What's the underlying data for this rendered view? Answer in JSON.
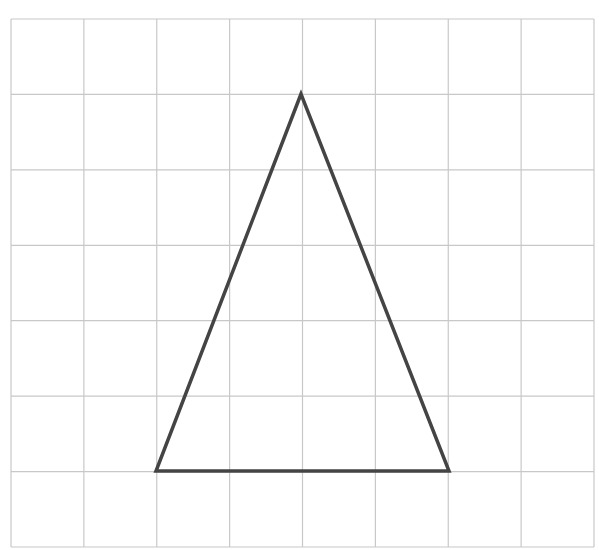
{
  "diagram": {
    "type": "grid-with-triangle",
    "grid": {
      "columns": 8,
      "rows": 7,
      "left": 11,
      "top": 19,
      "right": 594,
      "bottom": 547,
      "line_color": "#c8c8c8"
    },
    "triangle": {
      "vertices_grid": [
        [
          4,
          1
        ],
        [
          2,
          6
        ],
        [
          6,
          6
        ]
      ],
      "vertices_px": [
        [
          301,
          94
        ],
        [
          156,
          471
        ],
        [
          449,
          471
        ]
      ],
      "stroke_color": "#444444",
      "stroke_width": 3.5
    }
  }
}
